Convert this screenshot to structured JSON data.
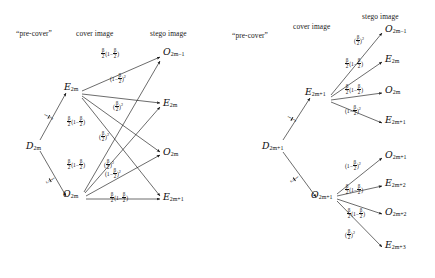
{
  "figure": {
    "symbol": "β",
    "panels": [
      {
        "id": "left",
        "headers": {
          "precover": "“pre-cover”",
          "cover": "cover image",
          "stego": "stego image"
        },
        "precover_nodes": [
          {
            "id": "D2m",
            "cal": "D",
            "sub": "2m"
          }
        ],
        "cover_nodes": [
          {
            "id": "E2m",
            "cal": "E",
            "sub": "2m"
          },
          {
            "id": "O2m",
            "cal": "O",
            "sub": "2m"
          }
        ],
        "stego_nodes": [
          {
            "id": "O2m-1",
            "cal": "O",
            "sub": "2m−1"
          },
          {
            "id": "E2m",
            "cal": "E",
            "sub": "2m"
          },
          {
            "id": "O2m",
            "cal": "O",
            "sub": "2m"
          },
          {
            "id": "E2m+1",
            "cal": "E",
            "sub": "2m+1"
          }
        ],
        "precover_edges": [
          {
            "from": "D2m",
            "to": "E2m",
            "label": "1/2"
          },
          {
            "from": "D2m",
            "to": "O2m",
            "label": "1/2"
          }
        ],
        "edge_labels": [
          {
            "from": "E2m",
            "to": "O2m-1",
            "label": "(β/2)(1−β/2)"
          },
          {
            "from": "E2m",
            "to": "E2m",
            "label": "(1−β/2)²"
          },
          {
            "from": "E2m",
            "to": "O2m",
            "label": "(β/2)²"
          },
          {
            "from": "E2m",
            "to": "E2m+1",
            "label": "(β/2)(1−β/2)"
          },
          {
            "from": "O2m",
            "to": "O2m-1",
            "label": "(β/2)(1−β/2)"
          },
          {
            "from": "O2m",
            "to": "E2m",
            "label": "(β/2)²"
          },
          {
            "from": "O2m",
            "to": "O2m",
            "label": "(1−β/2)²"
          },
          {
            "from": "O2m",
            "to": "E2m+1",
            "label": "(β/2)(1−β/2)"
          }
        ]
      },
      {
        "id": "right",
        "headers": {
          "precover": "“pre-cover”",
          "cover": "cover image",
          "stego": "stego image"
        },
        "precover_nodes": [
          {
            "id": "D2m+1",
            "cal": "D",
            "sub": "2m+1"
          }
        ],
        "cover_nodes": [
          {
            "id": "E2m+1",
            "cal": "E",
            "sub": "2m+1"
          },
          {
            "id": "O2m+1",
            "cal": "O",
            "sub": "2m+1"
          }
        ],
        "stego_nodes": [
          {
            "id": "O2m-1",
            "cal": "O",
            "sub": "2m−1"
          },
          {
            "id": "E2m",
            "cal": "E",
            "sub": "2m"
          },
          {
            "id": "O2m",
            "cal": "O",
            "sub": "2m"
          },
          {
            "id": "E2m+1",
            "cal": "E",
            "sub": "2m+1"
          },
          {
            "id": "O2m+1",
            "cal": "O",
            "sub": "2m+1"
          },
          {
            "id": "E2m+2",
            "cal": "E",
            "sub": "2m+2"
          },
          {
            "id": "O2m+2",
            "cal": "O",
            "sub": "2m+2"
          },
          {
            "id": "E2m+3",
            "cal": "E",
            "sub": "2m+3"
          }
        ],
        "precover_edges": [
          {
            "from": "D2m+1",
            "to": "E2m+1",
            "label": "1/2"
          },
          {
            "from": "D2m+1",
            "to": "O2m+1",
            "label": "1/2"
          }
        ],
        "edge_labels": [
          {
            "from": "E2m+1",
            "to": "O2m-1",
            "label": "(β/2)²"
          },
          {
            "from": "E2m+1",
            "to": "E2m",
            "label": "(β/2)(1−β/2)"
          },
          {
            "from": "E2m+1",
            "to": "O2m",
            "label": "(β/2)(1−β/2)"
          },
          {
            "from": "E2m+1",
            "to": "E2m+1",
            "label": "(1−β/2)²"
          },
          {
            "from": "O2m+1",
            "to": "O2m+1",
            "label": "(1−β/2)²"
          },
          {
            "from": "O2m+1",
            "to": "E2m+2",
            "label": "(β/2)(1−β/2)"
          },
          {
            "from": "O2m+1",
            "to": "O2m+2",
            "label": "(β/2)(1−β/2)"
          },
          {
            "from": "O2m+1",
            "to": "E2m+3",
            "label": "(β/2)²"
          }
        ]
      }
    ]
  }
}
